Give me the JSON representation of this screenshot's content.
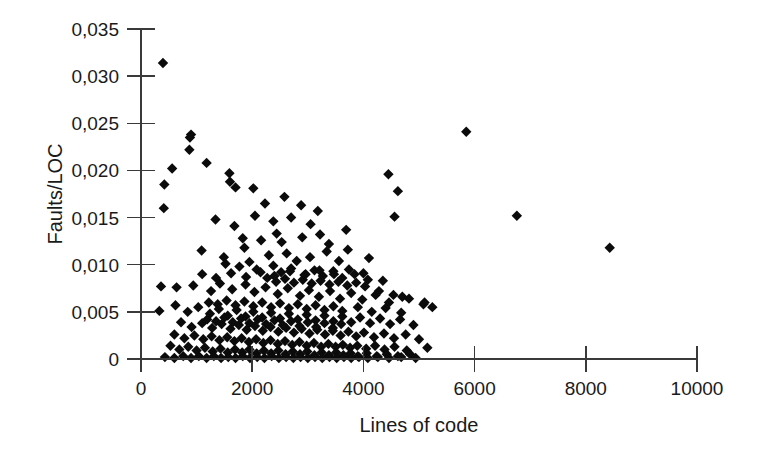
{
  "chart_data": {
    "type": "scatter",
    "title": "",
    "xlabel": "Lines of code",
    "ylabel": "Faults/LOC",
    "xlim": [
      0,
      10000
    ],
    "ylim": [
      0,
      0.035
    ],
    "grid": false,
    "legend": null,
    "decimal_separator": ",",
    "marker": "diamond",
    "marker_color": "#0b0b0b",
    "xticks": [
      0,
      2000,
      4000,
      6000,
      8000,
      10000
    ],
    "xtick_labels": [
      "0",
      "2000",
      "4000",
      "6000",
      "8000",
      "10000"
    ],
    "yticks": [
      0,
      0.005,
      0.01,
      0.015,
      0.02,
      0.025,
      0.03,
      0.035
    ],
    "ytick_labels": [
      "0",
      "0,005",
      "0,010",
      "0,015",
      "0,020",
      "0,025",
      "0,030",
      "0,035"
    ],
    "points": [
      [
        395,
        0.0314
      ],
      [
        420,
        0.0185
      ],
      [
        560,
        0.0202
      ],
      [
        900,
        0.0238
      ],
      [
        880,
        0.0235
      ],
      [
        870,
        0.0222
      ],
      [
        1180,
        0.0208
      ],
      [
        1590,
        0.0197
      ],
      [
        1600,
        0.0188
      ],
      [
        1700,
        0.0182
      ],
      [
        2020,
        0.0181
      ],
      [
        2580,
        0.0172
      ],
      [
        2230,
        0.0165
      ],
      [
        2880,
        0.0163
      ],
      [
        3180,
        0.0157
      ],
      [
        410,
        0.016
      ],
      [
        4450,
        0.0196
      ],
      [
        4620,
        0.0178
      ],
      [
        4560,
        0.0151
      ],
      [
        5850,
        0.0241
      ],
      [
        6760,
        0.0152
      ],
      [
        8430,
        0.0118
      ],
      [
        1090,
        0.0115
      ],
      [
        1830,
        0.0128
      ],
      [
        2160,
        0.0126
      ],
      [
        2440,
        0.0133
      ],
      [
        2530,
        0.0124
      ],
      [
        2900,
        0.0129
      ],
      [
        3220,
        0.0132
      ],
      [
        3380,
        0.0122
      ],
      [
        3690,
        0.0137
      ],
      [
        1860,
        0.0118
      ],
      [
        2300,
        0.011
      ],
      [
        2620,
        0.0112
      ],
      [
        2800,
        0.0104
      ],
      [
        3040,
        0.0108
      ],
      [
        3340,
        0.0114
      ],
      [
        3560,
        0.0104
      ],
      [
        1490,
        0.0108
      ],
      [
        1520,
        0.0101
      ],
      [
        1770,
        0.0098
      ],
      [
        1950,
        0.0103
      ],
      [
        2080,
        0.0095
      ],
      [
        2380,
        0.0099
      ],
      [
        2520,
        0.0092
      ],
      [
        2700,
        0.0096
      ],
      [
        2960,
        0.009
      ],
      [
        3120,
        0.0094
      ],
      [
        3270,
        0.0088
      ],
      [
        3460,
        0.0093
      ],
      [
        3620,
        0.0086
      ],
      [
        3840,
        0.009
      ],
      [
        4080,
        0.0084
      ],
      [
        360,
        0.0077
      ],
      [
        640,
        0.0076
      ],
      [
        940,
        0.0078
      ],
      [
        1260,
        0.0072
      ],
      [
        1420,
        0.008
      ],
      [
        1640,
        0.0074
      ],
      [
        1880,
        0.0079
      ],
      [
        2040,
        0.0071
      ],
      [
        2240,
        0.0076
      ],
      [
        2460,
        0.0069
      ],
      [
        2640,
        0.0075
      ],
      [
        2860,
        0.0067
      ],
      [
        3020,
        0.0073
      ],
      [
        3200,
        0.0066
      ],
      [
        3400,
        0.0072
      ],
      [
        3580,
        0.0064
      ],
      [
        3780,
        0.007
      ],
      [
        3980,
        0.0063
      ],
      [
        4220,
        0.0068
      ],
      [
        4460,
        0.006
      ],
      [
        4700,
        0.0066
      ],
      [
        5080,
        0.0058
      ],
      [
        5240,
        0.0055
      ],
      [
        330,
        0.0051
      ],
      [
        620,
        0.0057
      ],
      [
        840,
        0.005
      ],
      [
        1030,
        0.0055
      ],
      [
        1240,
        0.0048
      ],
      [
        1400,
        0.0053
      ],
      [
        1560,
        0.0046
      ],
      [
        1720,
        0.0052
      ],
      [
        1880,
        0.0045
      ],
      [
        2020,
        0.005
      ],
      [
        2180,
        0.0044
      ],
      [
        2340,
        0.0049
      ],
      [
        2500,
        0.0043
      ],
      [
        2660,
        0.0048
      ],
      [
        2820,
        0.0042
      ],
      [
        2980,
        0.0047
      ],
      [
        3140,
        0.0041
      ],
      [
        3300,
        0.0046
      ],
      [
        3460,
        0.004
      ],
      [
        3620,
        0.0045
      ],
      [
        3780,
        0.0039
      ],
      [
        3940,
        0.0044
      ],
      [
        4120,
        0.0038
      ],
      [
        4300,
        0.0043
      ],
      [
        4480,
        0.0037
      ],
      [
        4660,
        0.0042
      ],
      [
        4900,
        0.0036
      ],
      [
        720,
        0.0039
      ],
      [
        910,
        0.0034
      ],
      [
        1100,
        0.0038
      ],
      [
        1280,
        0.0033
      ],
      [
        1450,
        0.0037
      ],
      [
        1610,
        0.0032
      ],
      [
        1760,
        0.0036
      ],
      [
        1900,
        0.0031
      ],
      [
        2050,
        0.0035
      ],
      [
        2190,
        0.003
      ],
      [
        2330,
        0.0034
      ],
      [
        2470,
        0.0029
      ],
      [
        2610,
        0.0033
      ],
      [
        2750,
        0.0028
      ],
      [
        2890,
        0.0032
      ],
      [
        3030,
        0.0027
      ],
      [
        3170,
        0.0031
      ],
      [
        3310,
        0.0026
      ],
      [
        3450,
        0.003
      ],
      [
        3590,
        0.0025
      ],
      [
        3730,
        0.0029
      ],
      [
        3870,
        0.0024
      ],
      [
        4010,
        0.0028
      ],
      [
        4190,
        0.0023
      ],
      [
        4370,
        0.0027
      ],
      [
        4550,
        0.0022
      ],
      [
        4760,
        0.0026
      ],
      [
        5000,
        0.0021
      ],
      [
        600,
        0.0026
      ],
      [
        780,
        0.0022
      ],
      [
        960,
        0.0025
      ],
      [
        1120,
        0.0021
      ],
      [
        1270,
        0.0024
      ],
      [
        1410,
        0.002
      ],
      [
        1550,
        0.0023
      ],
      [
        1680,
        0.0019
      ],
      [
        1810,
        0.0022
      ],
      [
        1940,
        0.0018
      ],
      [
        2070,
        0.0021
      ],
      [
        2200,
        0.0017
      ],
      [
        2330,
        0.002
      ],
      [
        2460,
        0.0016
      ],
      [
        2590,
        0.0019
      ],
      [
        2720,
        0.0015
      ],
      [
        2850,
        0.0018
      ],
      [
        2980,
        0.0014
      ],
      [
        3110,
        0.0017
      ],
      [
        3240,
        0.0013
      ],
      [
        3370,
        0.0016
      ],
      [
        3500,
        0.0013
      ],
      [
        3630,
        0.0015
      ],
      [
        3760,
        0.0012
      ],
      [
        3890,
        0.0014
      ],
      [
        4050,
        0.0011
      ],
      [
        4210,
        0.0014
      ],
      [
        4380,
        0.001
      ],
      [
        4560,
        0.0013
      ],
      [
        4780,
        0.0009
      ],
      [
        5150,
        0.0012
      ],
      [
        530,
        0.0014
      ],
      [
        690,
        0.001
      ],
      [
        850,
        0.0013
      ],
      [
        1000,
        0.0009
      ],
      [
        1150,
        0.0012
      ],
      [
        1290,
        0.0008
      ],
      [
        1430,
        0.0011
      ],
      [
        1560,
        0.0007
      ],
      [
        1690,
        0.001
      ],
      [
        1820,
        0.0007
      ],
      [
        1950,
        0.001
      ],
      [
        2080,
        0.0006
      ],
      [
        2210,
        0.0009
      ],
      [
        2340,
        0.0006
      ],
      [
        2470,
        0.0009
      ],
      [
        2600,
        0.0005
      ],
      [
        2730,
        0.0008
      ],
      [
        2860,
        0.0005
      ],
      [
        2990,
        0.0008
      ],
      [
        3120,
        0.0004
      ],
      [
        3250,
        0.0007
      ],
      [
        3380,
        0.0004
      ],
      [
        3510,
        0.0007
      ],
      [
        3640,
        0.0004
      ],
      [
        3770,
        0.0006
      ],
      [
        3900,
        0.0003
      ],
      [
        4060,
        0.0006
      ],
      [
        4240,
        0.0003
      ],
      [
        4420,
        0.0005
      ],
      [
        4620,
        0.0003
      ],
      [
        4840,
        0.0005
      ],
      [
        430,
        0.0002
      ],
      [
        600,
        0.0001
      ],
      [
        760,
        0.0003
      ],
      [
        900,
        0.0001
      ],
      [
        1040,
        0.0003
      ],
      [
        1180,
        0.0001
      ],
      [
        1310,
        0.0003
      ],
      [
        1440,
        0.0001
      ],
      [
        1570,
        0.0002
      ],
      [
        1700,
        0.0001
      ],
      [
        1830,
        0.0003
      ],
      [
        1960,
        0.0001
      ],
      [
        2090,
        0.0002
      ],
      [
        2220,
        0.0001
      ],
      [
        2350,
        0.0003
      ],
      [
        2480,
        0.0001
      ],
      [
        2610,
        0.0002
      ],
      [
        2740,
        0.0001
      ],
      [
        2870,
        0.0002
      ],
      [
        3000,
        0.0001
      ],
      [
        3130,
        0.0002
      ],
      [
        3260,
        0.0001
      ],
      [
        3390,
        0.0002
      ],
      [
        3520,
        0.0001
      ],
      [
        3650,
        0.0002
      ],
      [
        3780,
        0.0001
      ],
      [
        3920,
        0.0002
      ],
      [
        4080,
        0.0001
      ],
      [
        4260,
        0.0002
      ],
      [
        4460,
        0.0001
      ],
      [
        4680,
        0.0002
      ],
      [
        4940,
        0.0001
      ],
      [
        1190,
        0.0042
      ],
      [
        1350,
        0.004
      ],
      [
        1500,
        0.0044
      ],
      [
        1650,
        0.0039
      ],
      [
        1800,
        0.0043
      ],
      [
        1950,
        0.0038
      ],
      [
        2100,
        0.0042
      ],
      [
        2250,
        0.0037
      ],
      [
        2400,
        0.0041
      ],
      [
        2550,
        0.0036
      ],
      [
        2700,
        0.004
      ],
      [
        2850,
        0.0035
      ],
      [
        3000,
        0.0039
      ],
      [
        3150,
        0.0034
      ],
      [
        3300,
        0.0038
      ],
      [
        3450,
        0.0033
      ],
      [
        3600,
        0.0037
      ],
      [
        1220,
        0.006
      ],
      [
        1380,
        0.0058
      ],
      [
        1540,
        0.0062
      ],
      [
        1700,
        0.0057
      ],
      [
        1860,
        0.0061
      ],
      [
        2020,
        0.0056
      ],
      [
        2180,
        0.006
      ],
      [
        2340,
        0.0055
      ],
      [
        2500,
        0.0059
      ],
      [
        2660,
        0.0054
      ],
      [
        2820,
        0.0058
      ],
      [
        2980,
        0.0053
      ],
      [
        3140,
        0.0057
      ],
      [
        3300,
        0.0052
      ],
      [
        3460,
        0.0056
      ],
      [
        3620,
        0.0051
      ],
      [
        3900,
        0.0055
      ],
      [
        4150,
        0.005
      ],
      [
        4400,
        0.0054
      ],
      [
        4680,
        0.0049
      ],
      [
        2270,
        0.0086
      ],
      [
        2430,
        0.0082
      ],
      [
        2590,
        0.0085
      ],
      [
        2750,
        0.0081
      ],
      [
        2910,
        0.0084
      ],
      [
        3070,
        0.008
      ],
      [
        3230,
        0.0083
      ],
      [
        3390,
        0.0079
      ],
      [
        3550,
        0.0082
      ],
      [
        3710,
        0.0078
      ],
      [
        3870,
        0.0081
      ],
      [
        4030,
        0.0077
      ],
      [
        1100,
        0.009
      ],
      [
        1350,
        0.0086
      ],
      [
        1620,
        0.0091
      ],
      [
        1890,
        0.0087
      ],
      [
        2150,
        0.0092
      ],
      [
        2400,
        0.0088
      ],
      [
        2680,
        0.0093
      ],
      [
        2940,
        0.0089
      ],
      [
        3210,
        0.0094
      ],
      [
        3470,
        0.009
      ],
      [
        3740,
        0.0095
      ],
      [
        4000,
        0.0091
      ],
      [
        4280,
        0.0072
      ],
      [
        4540,
        0.0068
      ],
      [
        4820,
        0.0064
      ],
      [
        5100,
        0.006
      ],
      [
        2050,
        0.0152
      ],
      [
        2380,
        0.0146
      ],
      [
        2700,
        0.015
      ],
      [
        3050,
        0.0143
      ],
      [
        1340,
        0.0148
      ],
      [
        1680,
        0.0141
      ],
      [
        3720,
        0.0116
      ],
      [
        4100,
        0.0107
      ],
      [
        4350,
        0.0083
      ]
    ]
  },
  "axes": {
    "x_axis_name": "x-axis",
    "y_axis_name": "y-axis"
  }
}
